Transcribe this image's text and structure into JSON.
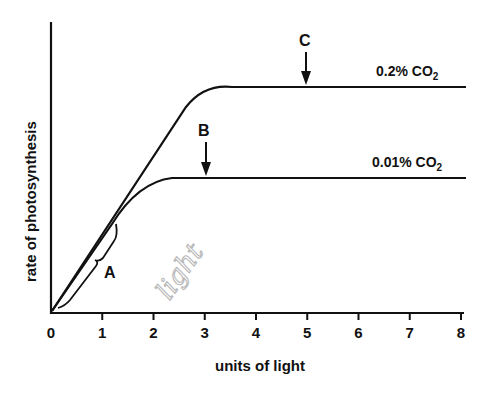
{
  "chart_data": {
    "type": "line",
    "title": "",
    "xlabel": "units of light",
    "ylabel": "rate of photosynthesis",
    "xlim": [
      0,
      8
    ],
    "x_ticks": [
      "0",
      "1",
      "2",
      "3",
      "4",
      "5",
      "6",
      "7",
      "8"
    ],
    "y_ticks": [],
    "grid": false,
    "legend": "inline labels at right end of each curve",
    "series": [
      {
        "name": "0.2% CO2",
        "label_main": "0.2% CO",
        "label_sub": "2",
        "points": [
          [
            0,
            0
          ],
          [
            1,
            0.27
          ],
          [
            2,
            0.6
          ],
          [
            2.6,
            0.75
          ],
          [
            3,
            0.8
          ],
          [
            3.5,
            0.81
          ],
          [
            8,
            0.81
          ]
        ],
        "plateau_starts_at": 3.5
      },
      {
        "name": "0.01% CO2",
        "label_main": "0.01% CO",
        "label_sub": "2",
        "points": [
          [
            0,
            0
          ],
          [
            1,
            0.3
          ],
          [
            1.5,
            0.42
          ],
          [
            2,
            0.47
          ],
          [
            2.5,
            0.49
          ],
          [
            8,
            0.49
          ]
        ],
        "plateau_starts_at": 2.4
      }
    ],
    "annotations": [
      {
        "label": "A",
        "type": "brace",
        "description": "brace along the initial linear rise (x 0 to ~1.3)"
      },
      {
        "label": "B",
        "type": "arrow-down",
        "x": 3,
        "target": "0.01% CO2 plateau"
      },
      {
        "label": "C",
        "type": "arrow-down",
        "x": 5,
        "target": "0.2% CO2 plateau"
      },
      {
        "label": "light",
        "type": "handwritten",
        "description": "pencil scribble near brace A"
      }
    ]
  }
}
